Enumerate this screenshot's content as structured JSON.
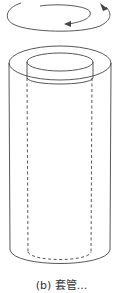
{
  "figure": {
    "type": "sleeve-cylinder-rotation-diagram",
    "stroke_color": "#444444",
    "rotation_arrow": "circular-rotation-arrow",
    "outer_cylinder": "solid-outline",
    "inner_cylinder": "dashed-hidden-lines"
  },
  "caption": {
    "text": "(b) 套管...",
    "truncated": true
  }
}
